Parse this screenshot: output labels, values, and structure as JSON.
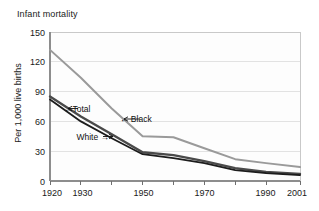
{
  "chart_data": {
    "type": "line",
    "title": "Infant mortality",
    "xlabel": "",
    "ylabel": "Per 1,000 live births",
    "x": [
      1920,
      1930,
      1940,
      1950,
      1960,
      1970,
      1980,
      1990,
      2001
    ],
    "xlim": [
      1920,
      2001
    ],
    "ylim": [
      0,
      150
    ],
    "yticks": [
      0,
      30,
      60,
      90,
      120,
      150
    ],
    "xticks": [
      1920,
      1930,
      1940,
      1950,
      1960,
      1970,
      1980,
      1990,
      2001
    ],
    "xtick_labels_visible": [
      "1920",
      "1930",
      "1950",
      "1970",
      "1990",
      "2001"
    ],
    "grid": true,
    "legend_position": "inline-annotations",
    "series": [
      {
        "name": "Black",
        "color": "#9a9a9a",
        "values": [
          132,
          104,
          73,
          45,
          44,
          33,
          22,
          18,
          14
        ]
      },
      {
        "name": "Total",
        "color": "#4a4a4a",
        "values": [
          85,
          65,
          47,
          29,
          26,
          20,
          13,
          9,
          7
        ]
      },
      {
        "name": "White",
        "color": "#1c1c1c",
        "values": [
          82,
          60,
          43,
          27,
          23,
          18,
          11,
          8,
          6
        ]
      }
    ],
    "annotations": [
      {
        "text": "←Total",
        "series": "Total"
      },
      {
        "text": "White →",
        "series": "White"
      },
      {
        "text": "← Black",
        "series": "Black"
      }
    ]
  },
  "axes": {
    "ytick_0": "0",
    "ytick_30": "30",
    "ytick_60": "60",
    "ytick_90": "90",
    "ytick_120": "120",
    "ytick_150": "150",
    "xtick_1920": "1920",
    "xtick_1930": "1930",
    "xtick_1950": "1950",
    "xtick_1970": "1970",
    "xtick_1990": "1990",
    "xtick_2001": "2001"
  },
  "labels": {
    "total": "←Total",
    "white": "White →",
    "black": "← Black"
  }
}
